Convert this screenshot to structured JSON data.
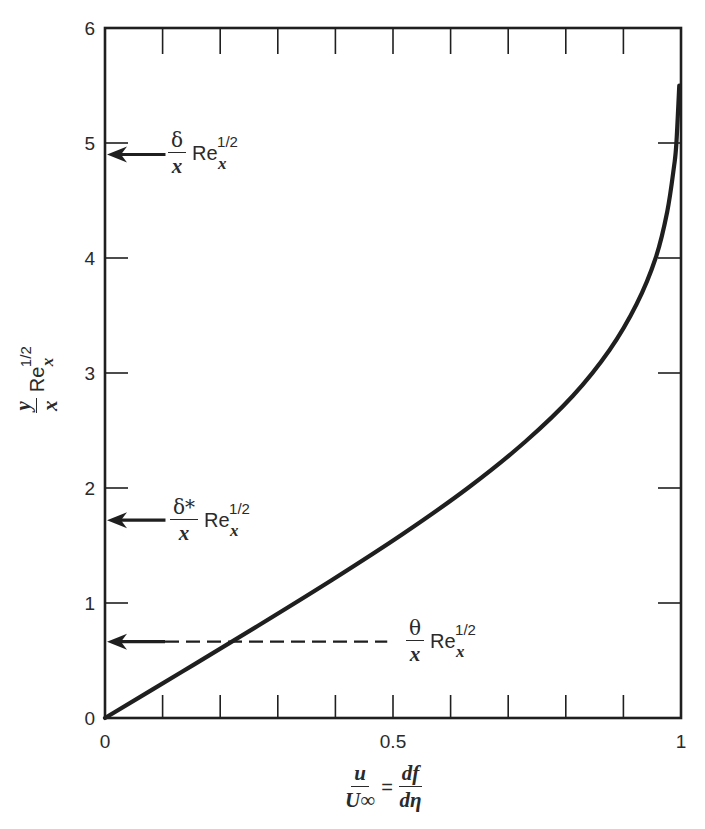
{
  "chart_data": {
    "type": "line",
    "title": "",
    "xlabel": "u / U∞ = df / dη",
    "ylabel": "(y / x) Re_x^(1/2)",
    "xlim": [
      0,
      1
    ],
    "ylim": [
      0,
      6
    ],
    "grid": false,
    "x_ticks": [
      0,
      0.1,
      0.2,
      0.3,
      0.4,
      0.5,
      0.6,
      0.7,
      0.8,
      0.9,
      1.0
    ],
    "x_tick_labels": [
      "0",
      "0.5",
      "1"
    ],
    "x_tick_label_values": [
      0,
      0.5,
      1
    ],
    "y_ticks": [
      0,
      1,
      2,
      3,
      4,
      5,
      6
    ],
    "y_tick_labels": [
      "0",
      "1",
      "2",
      "3",
      "4",
      "5",
      "6"
    ],
    "series": [
      {
        "name": "Blasius velocity profile",
        "x": [
          0,
          0.133,
          0.265,
          0.394,
          0.517,
          0.63,
          0.729,
          0.812,
          0.876,
          0.923,
          0.956,
          0.976,
          0.988,
          0.992,
          0.997
        ],
        "y": [
          0,
          0.4,
          0.8,
          1.2,
          1.6,
          2.0,
          2.4,
          2.8,
          3.2,
          3.6,
          4.0,
          4.4,
          4.8,
          5.0,
          5.5
        ],
        "style": "solid"
      }
    ],
    "annotations": [
      {
        "id": "delta",
        "label": "δ/x Re_x^1/2",
        "y": 4.9,
        "arrow_from_x": 0.105,
        "style": "solid"
      },
      {
        "id": "delta_star",
        "label": "δ*/x Re_x^1/2",
        "y": 1.72,
        "arrow_from_x": 0.105,
        "style": "solid"
      },
      {
        "id": "theta",
        "label": "θ/x Re_x^1/2",
        "y": 0.664,
        "arrow_from_x": 0.49,
        "style": "dashed"
      }
    ]
  },
  "axes": {
    "y_tick_labels": [
      "0",
      "1",
      "2",
      "3",
      "4",
      "5",
      "6"
    ],
    "x_tick_labels": [
      "0",
      "0.5",
      "1"
    ],
    "origin_label": "0"
  },
  "labels": {
    "ylabel": {
      "num": "y",
      "den": "x",
      "re": "Re",
      "sup": "1/2",
      "sub": "x"
    },
    "xlabel": {
      "lhs_num": "u",
      "lhs_den": "U∞",
      "eq": "=",
      "rhs_num": "df",
      "rhs_den": "dη"
    },
    "delta": {
      "num": "δ",
      "den": "x",
      "re": "Re",
      "sup": "1/2",
      "sub": "x"
    },
    "delta_star": {
      "num": "δ*",
      "den": "x",
      "re": "Re",
      "sup": "1/2",
      "sub": "x"
    },
    "theta": {
      "num": "θ",
      "den": "x",
      "re": "Re",
      "sup": "1/2",
      "sub": "x"
    }
  },
  "colors": {
    "ink": "#1f1f1f",
    "background": "#ffffff"
  }
}
